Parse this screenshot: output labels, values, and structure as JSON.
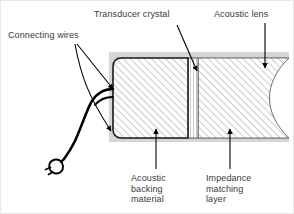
{
  "figure": {
    "width": 294,
    "height": 214,
    "background_color": "#ffffff"
  },
  "labels": {
    "connecting_wires": "Connecting wires",
    "transducer_crystal": "Transducer crystal",
    "acoustic_lens": "Acoustic lens",
    "acoustic_backing_material": "Acoustic\nbacking\nmaterial",
    "impedance_matching_layer": "Impedance\nmatching\nlayer"
  },
  "colors": {
    "label_text": "#3a3a3a",
    "line": "#000000",
    "housing_fill": "#d6d6d6",
    "hatch": "#7a7a7a",
    "crystal_line": "#8a8a8a",
    "lens_fill": "#ffffff",
    "backing_fill": "#ffffff",
    "matching_fill": "#ffffff",
    "frame_border": "#e8e8e8"
  },
  "components": [
    {
      "name": "acoustic-backing-material",
      "label": "Acoustic backing material",
      "hatch": "diagonal-45",
      "fill": "#ffffff"
    },
    {
      "name": "transducer-crystal",
      "label": "Transducer crystal",
      "hatch": "vertical",
      "fill": "#ffffff"
    },
    {
      "name": "impedance-matching-layer",
      "label": "Impedance matching layer",
      "hatch": "diagonal-45",
      "fill": "#ffffff"
    },
    {
      "name": "acoustic-lens",
      "label": "Acoustic lens",
      "hatch": "none",
      "fill": "#ffffff"
    },
    {
      "name": "connecting-wires",
      "label": "Connecting wires",
      "hatch": "none",
      "fill": "none"
    },
    {
      "name": "housing",
      "label": "Housing",
      "hatch": "none",
      "fill": "#d6d6d6"
    }
  ],
  "annotations": {
    "arrow_count": 6,
    "leaders": [
      {
        "name": "connecting-wires-upper-arrow",
        "from_label": "connecting_wires",
        "to": "housing-left-upper"
      },
      {
        "name": "connecting-wires-lower-arrow",
        "from_label": "connecting_wires",
        "to": "housing-left-lower"
      },
      {
        "name": "transducer-crystal-arrow",
        "from_label": "transducer_crystal",
        "to": "crystal-strip"
      },
      {
        "name": "acoustic-lens-arrow",
        "from_label": "acoustic_lens",
        "to": "lens-region"
      },
      {
        "name": "acoustic-backing-arrow",
        "from_label": "acoustic_backing_material",
        "to": "backing-block"
      },
      {
        "name": "impedance-matching-arrow",
        "from_label": "impedance_matching_layer",
        "to": "matching-block"
      }
    ]
  }
}
